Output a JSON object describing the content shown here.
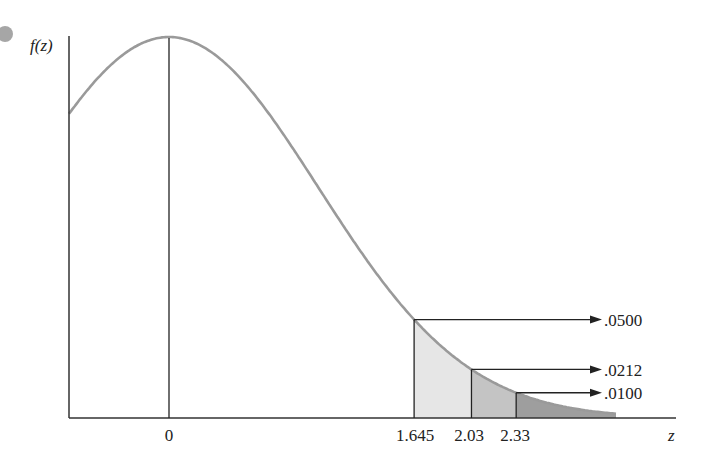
{
  "figure": {
    "y_axis_label": "f(z)",
    "x_axis_label": "z",
    "bullet_color": "#a6a6a6",
    "curve_color": "#9a9a9a",
    "shade_colors": [
      "#e6e6e6",
      "#c4c4c4",
      "#9e9e9e"
    ],
    "ticks": [
      {
        "label": "0",
        "z": 0
      },
      {
        "label": "1.645",
        "z": 1.645
      },
      {
        "label": "2.03",
        "z": 2.03
      },
      {
        "label": "2.33",
        "z": 2.33
      }
    ],
    "tail_areas": [
      {
        "z": 1.645,
        "label": ".0500"
      },
      {
        "z": 2.03,
        "label": ".0212"
      },
      {
        "z": 2.33,
        "label": ".0100"
      }
    ]
  },
  "chart_data": {
    "type": "area",
    "title": "",
    "xlabel": "z",
    "ylabel": "f(z)",
    "x_ticks": [
      "0",
      "1.645",
      "2.03",
      "2.33"
    ],
    "xlim": [
      -0.67,
      3.4
    ],
    "series": [
      {
        "name": "P(Z > 1.645)",
        "z": 1.645,
        "value": 0.05
      },
      {
        "name": "P(Z > 2.03)",
        "z": 2.03,
        "value": 0.0212
      },
      {
        "name": "P(Z > 2.33)",
        "z": 2.33,
        "value": 0.01
      }
    ]
  }
}
